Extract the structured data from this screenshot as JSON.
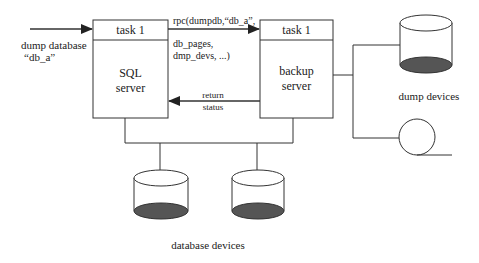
{
  "diagram": {
    "type": "system-architecture",
    "colors": {
      "stroke": "#333333",
      "fill_dark": "#555555",
      "text": "#222222",
      "background": "#ffffff"
    },
    "input": {
      "line1": "dump database",
      "line2": "“db_a”"
    },
    "sql_server": {
      "task_label": "task 1",
      "line1": "SQL",
      "line2": "server"
    },
    "backup_server": {
      "task_label": "task 1",
      "line1": "backup",
      "line2": "server"
    },
    "rpc_call": {
      "line1": "rpc(dumpdb,“db_a”,",
      "line2": "db_pages,",
      "line3": "dmp_devs, ...)"
    },
    "return_status": {
      "line1": "return",
      "line2": "status"
    },
    "dump_devices": {
      "label": "dump devices",
      "items": [
        "disk-cylinder",
        "tape-reel"
      ]
    },
    "database_devices": {
      "label": "database devices",
      "count": 2
    }
  }
}
